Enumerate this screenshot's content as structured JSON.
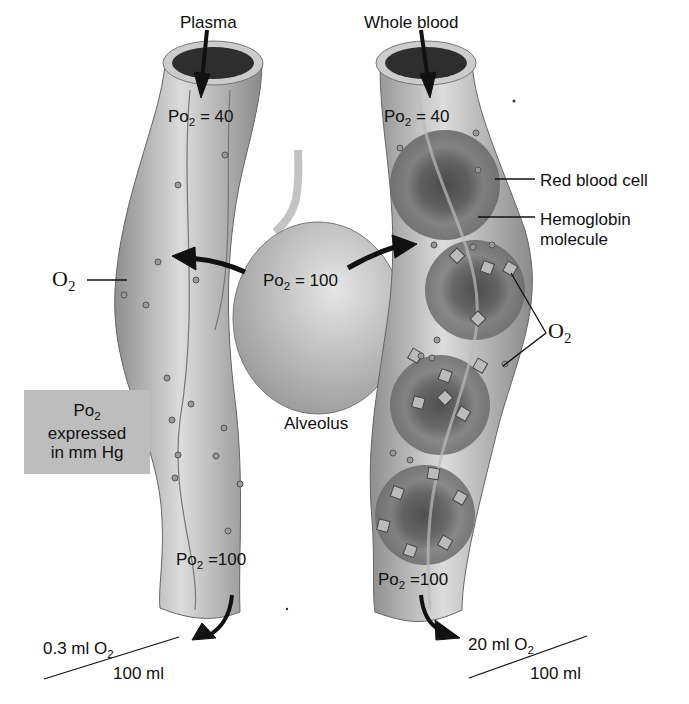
{
  "left_vessel": {
    "label": "Plasma",
    "po2_in": {
      "prefix": "Po",
      "sub": "2",
      "value": " = 40"
    },
    "po2_out": {
      "prefix": "Po",
      "sub": "2",
      "value": " =100"
    },
    "o2_label": {
      "prefix": "O",
      "sub": "2"
    },
    "content": {
      "numerator_prefix": "0.3 ml O",
      "numerator_sub": "2",
      "denominator": "100 ml"
    }
  },
  "alveolus": {
    "label": "Alveolus",
    "po2": {
      "prefix": "Po",
      "sub": "2",
      "value": " = 100"
    }
  },
  "right_vessel": {
    "label": "Whole blood",
    "po2_in": {
      "prefix": "Po",
      "sub": "2",
      "value": " = 40"
    },
    "po2_out": {
      "prefix": "Po",
      "sub": "2",
      "value": " =100"
    },
    "callouts": {
      "red_blood_cell": "Red blood cell",
      "hemoglobin_line1": "Hemoglobin",
      "hemoglobin_line2": "molecule",
      "o2_prefix": "O",
      "o2_sub": "2"
    },
    "content": {
      "numerator_prefix": "20 ml O",
      "numerator_sub": "2",
      "denominator": "100 ml"
    }
  },
  "note_box": {
    "line1_prefix": "Po",
    "line1_sub": "2",
    "line2": "expressed",
    "line3": "in mm Hg"
  },
  "colors": {
    "vessel": "#a9a9a9",
    "vessel_light": "#d9d9d9",
    "lumen": "#333333",
    "rbc": "#6e6e6e",
    "box": "#bdbdbd"
  }
}
